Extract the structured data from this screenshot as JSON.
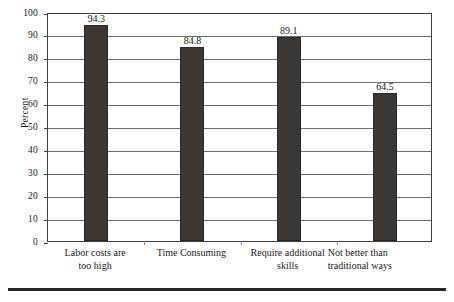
{
  "chart_data": {
    "type": "bar",
    "title": "",
    "subtitle": "",
    "xlabel": "",
    "ylabel": "Percent",
    "ylim": [
      0,
      100
    ],
    "ytick_step": 10,
    "yticks": [
      0,
      10,
      20,
      30,
      40,
      50,
      60,
      70,
      80,
      90,
      100
    ],
    "ytick_labels": [
      "0",
      "10",
      "20",
      "30",
      "40",
      "50",
      "60",
      "70",
      "80",
      "90",
      "100"
    ],
    "grid": "horizontal",
    "legend": "none",
    "categories": [
      "Labor costs  are too high",
      "Time Consuming",
      "Require additional skills",
      "Not better than traditional ways"
    ],
    "category_lines": [
      [
        "Labor costs  are",
        "too high"
      ],
      [
        "Time Consuming"
      ],
      [
        "Require additional",
        "skills"
      ],
      [
        "Not better than",
        "traditional ways"
      ]
    ],
    "values": [
      94.3,
      84.8,
      89.1,
      64.5
    ],
    "value_labels": [
      "94.3",
      "84.8",
      "89.1",
      "64.5"
    ],
    "bar_color": "#3b3734",
    "grid_color": "#6d6d6d",
    "axis_color": "#3f3f3f",
    "background_color": "#ffffff"
  }
}
